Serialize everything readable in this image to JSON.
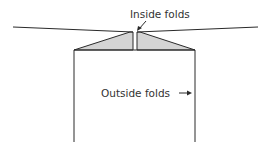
{
  "diagram": {
    "labels": {
      "inside_folds": "Inside folds",
      "outside_folds": "Outside folds"
    },
    "colors": {
      "stroke": "#2a2a2a",
      "fill": "#d4d4d4",
      "text": "#333333"
    }
  }
}
